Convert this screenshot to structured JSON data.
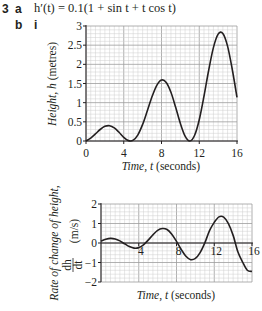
{
  "question": {
    "number": "3",
    "part_a": "a",
    "expression": "h′(t) = 0.1(1 + sin t + t cos t)",
    "part_b": "b",
    "sub_part": "i"
  },
  "chart_data": [
    {
      "type": "line",
      "title": "",
      "xlabel": "Time, t (seconds)",
      "ylabel": "Height, h (metres)",
      "xlim": [
        0,
        16
      ],
      "ylim": [
        0,
        3
      ],
      "xticks": [
        0,
        4,
        8,
        12,
        16
      ],
      "yticks": [
        0,
        0.5,
        1,
        1.5,
        2,
        2.5,
        3
      ],
      "ytick_labels": [
        "0",
        "0.5",
        "1",
        "1.5",
        "2",
        "2.5",
        "3"
      ],
      "grid": true,
      "x": [
        0,
        0.5,
        1,
        1.5,
        2,
        2.5,
        3,
        3.5,
        4,
        4.5,
        5,
        5.5,
        6,
        6.5,
        7,
        7.5,
        8,
        8.5,
        9,
        9.5,
        10,
        10.5,
        11,
        11.5,
        12,
        12.5,
        13,
        13.5,
        14,
        14.5,
        15,
        15.5,
        16
      ],
      "series": [
        {
          "name": "h(t)",
          "values": [
            0,
            0.074,
            0.184,
            0.3,
            0.382,
            0.4,
            0.342,
            0.227,
            0.097,
            0.01,
            0.021,
            0.162,
            0.433,
            0.79,
            1.16,
            1.453,
            1.591,
            1.528,
            1.271,
            0.879,
            0.456,
            0.127,
            0.0,
            0.144,
            0.556,
            1.168,
            1.846,
            2.435,
            2.787,
            2.806,
            2.475,
            1.865,
            1.139
          ]
        }
      ]
    },
    {
      "type": "line",
      "title": "",
      "xlabel": "Time, t (seconds)",
      "ylabel": "Rate of change of height, dh/dt (m/s)",
      "ylabel_line1": "Rate of change of height,",
      "ylabel_frac_num": "dh",
      "ylabel_frac_den": "dt",
      "ylabel_units": "(m/s)",
      "xlim": [
        0,
        16
      ],
      "ylim": [
        -2,
        2
      ],
      "xticks": [
        4,
        8,
        12,
        16
      ],
      "yticks": [
        -2,
        -1,
        0,
        1,
        2
      ],
      "ytick_labels": [
        "−2",
        "−1",
        "0",
        "1",
        "2"
      ],
      "grid": true,
      "x": [
        0,
        0.5,
        1,
        1.5,
        2,
        2.5,
        3,
        3.5,
        4,
        4.5,
        5,
        5.5,
        6,
        6.5,
        7,
        7.5,
        8,
        8.5,
        9,
        9.5,
        10,
        10.5,
        11,
        11.5,
        12,
        12.5,
        13,
        13.5,
        14,
        14.5,
        15,
        15.5,
        16
      ],
      "series": [
        {
          "name": "h'(t)",
          "values": [
            0.1,
            0.192,
            0.238,
            0.21,
            0.108,
            -0.04,
            -0.183,
            -0.263,
            -0.237,
            -0.093,
            0.146,
            0.419,
            0.648,
            0.745,
            0.693,
            0.454,
            0.083,
            -0.33,
            -0.679,
            -0.855,
            -0.794,
            -0.495,
            0.005,
            0.634,
            1.059,
            1.341,
            1.325,
            0.991,
            0.391,
            -0.449,
            -0.974,
            -1.398,
            -1.459
          ]
        }
      ]
    }
  ]
}
